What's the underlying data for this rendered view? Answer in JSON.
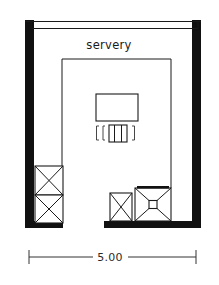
{
  "drawing": {
    "type": "architectural-floor-plan",
    "title_label": "servery",
    "dimension": {
      "value": "5.00",
      "position": "bottom",
      "unit_implied": "metres"
    },
    "colors": {
      "wall": "#111111",
      "line": "#1a1a1a",
      "background": "#ffffff",
      "dimension": "#333333"
    },
    "walls": {
      "left": {
        "label": "left-wall",
        "style": "solid-poche"
      },
      "right": {
        "label": "right-wall",
        "style": "solid-poche"
      },
      "bottom": {
        "label": "bottom-wall",
        "style": "solid-poche"
      },
      "top": {
        "label": "top-opening",
        "style": "thin-double-line"
      }
    },
    "fixtures": [
      {
        "id": "counter-island",
        "label": "counter-island",
        "symbol": "rectangle"
      },
      {
        "id": "appliance-center",
        "label": "center-appliance",
        "symbol": "bracketed-unit"
      },
      {
        "id": "unit-left-upper",
        "label": "left-upper-unit",
        "symbol": "x-box"
      },
      {
        "id": "unit-left-lower",
        "label": "left-lower-unit",
        "symbol": "x-box"
      },
      {
        "id": "unit-bottom-small",
        "label": "bottom-small-unit",
        "symbol": "x-box"
      },
      {
        "id": "hob-bottom-right",
        "label": "bottom-right-hob",
        "symbol": "x-box-with-center"
      }
    ],
    "inner_outline": {
      "label": "inner-room-outline",
      "style": "thin-line"
    }
  }
}
